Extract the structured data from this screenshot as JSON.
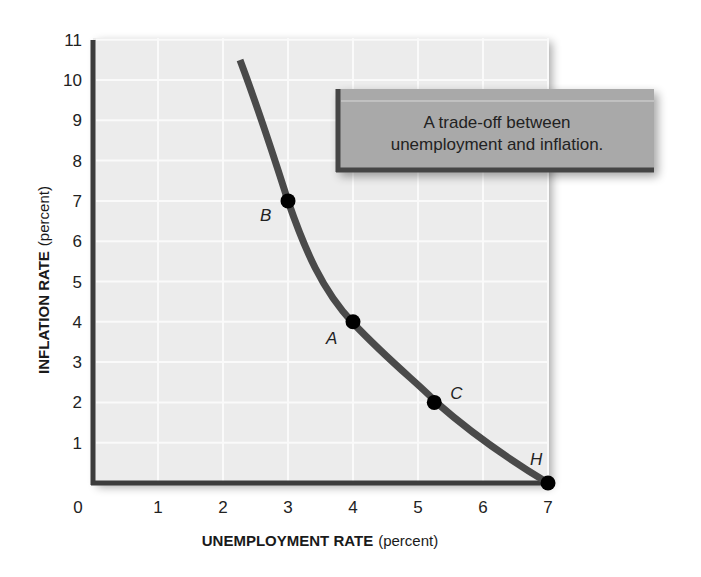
{
  "chart_data": {
    "type": "line",
    "title": "",
    "xlabel": "UNEMPLOYMENT RATE",
    "xlabel_unit": "(percent)",
    "ylabel": "INFLATION RATE",
    "ylabel_unit": "(percent)",
    "xlim": [
      0,
      7
    ],
    "ylim": [
      0,
      11
    ],
    "x_ticks": [
      "0",
      "1",
      "2",
      "3",
      "4",
      "5",
      "6",
      "7"
    ],
    "y_ticks": [
      "1",
      "2",
      "3",
      "4",
      "5",
      "6",
      "7",
      "8",
      "9",
      "10",
      "11"
    ],
    "grid": true,
    "legend": null,
    "series": [
      {
        "name": "Phillips curve",
        "x": [
          2.25,
          3.0,
          4.0,
          5.25,
          7.0
        ],
        "y": [
          10.5,
          7.0,
          4.0,
          2.0,
          0.0
        ]
      }
    ],
    "points": [
      {
        "label": "B",
        "x": 3.0,
        "y": 7.0
      },
      {
        "label": "A",
        "x": 4.0,
        "y": 4.0
      },
      {
        "label": "C",
        "x": 5.25,
        "y": 2.0
      },
      {
        "label": "H",
        "x": 7.0,
        "y": 0.0
      }
    ],
    "annotation": {
      "line1": "A trade-off between",
      "line2": "unemployment and inflation."
    }
  },
  "colors": {
    "curve": "#4a4a4a",
    "axis": "#3c3c3c",
    "plot_bg": "#ececec",
    "grid": "#fafafa",
    "annotation_bg": "#a9a9a9",
    "annotation_border": "#444444",
    "point": "#000000"
  }
}
